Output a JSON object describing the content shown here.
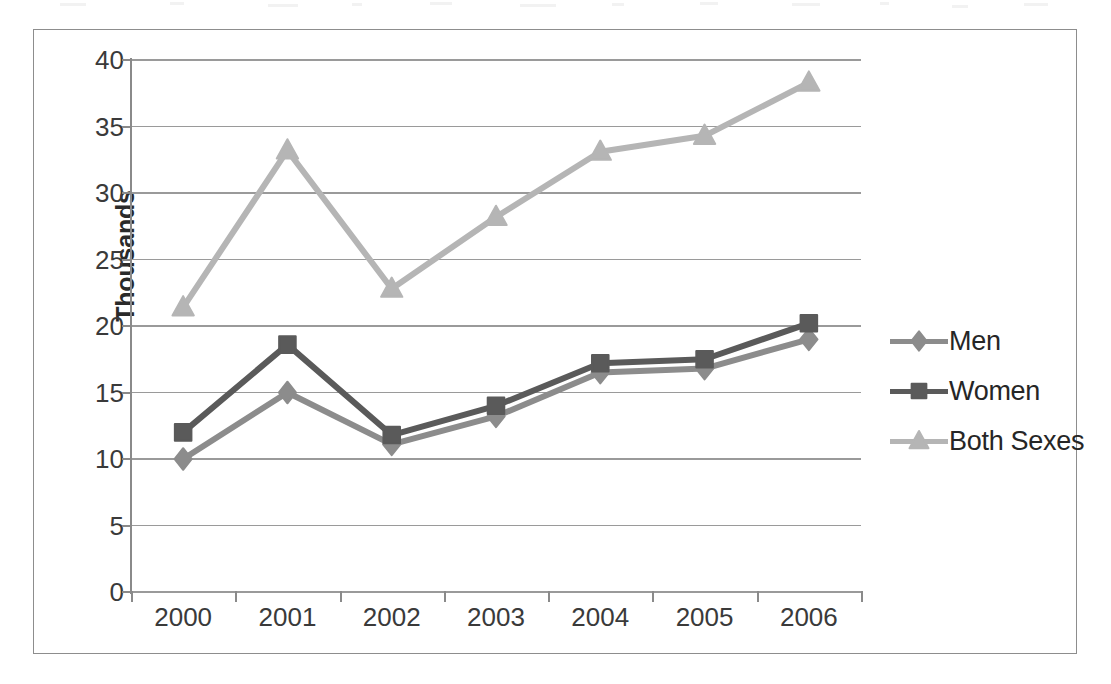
{
  "chart_data": {
    "type": "line",
    "title": "",
    "subtitle": "",
    "xlabel": "",
    "ylabel": "Thousands",
    "categories": [
      "2000",
      "2001",
      "2002",
      "2003",
      "2004",
      "2005",
      "2006"
    ],
    "ylim": [
      0,
      40
    ],
    "y_ticks": [
      "0",
      "5",
      "10",
      "15",
      "20",
      "25",
      "30",
      "35",
      "40"
    ],
    "y_tick_values": [
      0,
      5,
      10,
      15,
      20,
      25,
      30,
      35,
      40
    ],
    "grid": true,
    "legend_position": "right",
    "series": [
      {
        "name": "Men",
        "marker": "diamond",
        "color": "#8c8c8c",
        "values": [
          10.0,
          15.0,
          11.1,
          13.2,
          16.5,
          16.8,
          19.0
        ]
      },
      {
        "name": "Women",
        "marker": "square",
        "color": "#5a5a5a",
        "values": [
          12.0,
          18.6,
          11.8,
          14.0,
          17.2,
          17.5,
          20.2
        ]
      },
      {
        "name": "Both Sexes",
        "marker": "triangle",
        "color": "#b5b5b5",
        "values": [
          21.4,
          33.2,
          22.8,
          28.2,
          33.1,
          34.3,
          38.3
        ]
      }
    ]
  },
  "axis": {
    "y_title": "Thousands"
  },
  "legend": {
    "entries": [
      {
        "label": "Men"
      },
      {
        "label": "Women"
      },
      {
        "label": "Both Sexes"
      }
    ]
  },
  "colors": {
    "men": "#8c8c8c",
    "women": "#5a5a5a",
    "both_sexes": "#b5b5b5",
    "gridline": "#9a9a9a",
    "axis": "#8a8a8a",
    "text": "#3a3a3a",
    "frame": "#8d8d8d",
    "background": "#ffffff"
  }
}
